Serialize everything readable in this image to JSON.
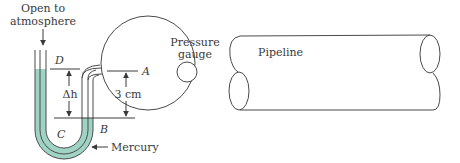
{
  "diagram": {
    "labels": {
      "open_line1": "Open to",
      "open_line2": "atmosphere",
      "point_d": "D",
      "point_a": "A",
      "point_b": "B",
      "point_c": "C",
      "delta_h": "Δh",
      "distance": "3 cm",
      "gauge_line1": "Pressure",
      "gauge_line2": "gauge",
      "mercury": "Mercury",
      "pipeline": "Pipeline"
    },
    "colors": {
      "mercury_fill": "#9fd4c4",
      "stroke": "#4a4a4a",
      "text": "#3a3a3a"
    }
  }
}
